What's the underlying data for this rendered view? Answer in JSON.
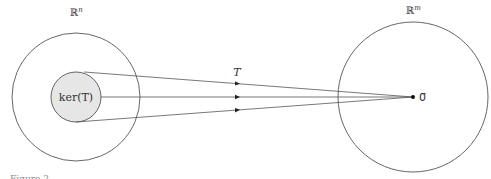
{
  "diagram": {
    "domain_space_label": "ℝ",
    "domain_space_superscript": "n",
    "codomain_space_label": "ℝ",
    "codomain_space_superscript": "m",
    "kernel_label": "ker(T)",
    "map_label": "T",
    "zero_vector_label": "0⃗",
    "caption_partial": "Figure 2",
    "colors": {
      "stroke": "#555555",
      "kernel_fill": "#e6e6e6",
      "text": "#333333",
      "point": "#111111"
    },
    "arrow_count": 3
  }
}
